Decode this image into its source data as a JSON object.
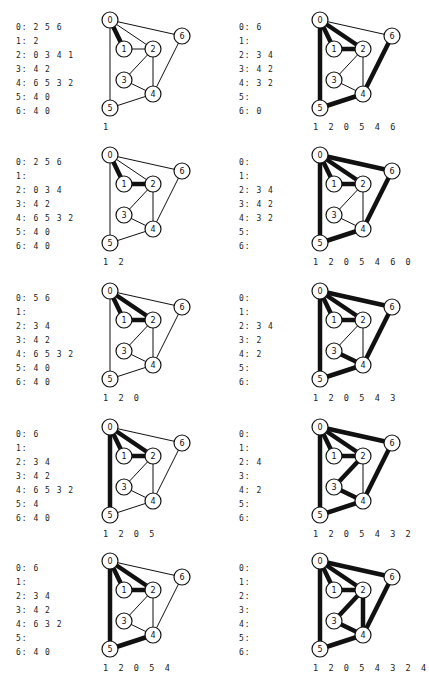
{
  "figure": {
    "nodes": [
      {
        "id": "0",
        "x": 15,
        "y": 0
      },
      {
        "id": "1",
        "x": 29,
        "y": 29
      },
      {
        "id": "2",
        "x": 58,
        "y": 29
      },
      {
        "id": "3",
        "x": 29,
        "y": 60
      },
      {
        "id": "4",
        "x": 58,
        "y": 74
      },
      {
        "id": "5",
        "x": 15,
        "y": 88
      },
      {
        "id": "6",
        "x": 87,
        "y": 16
      }
    ],
    "edges": [
      "0-1",
      "0-2",
      "0-5",
      "0-6",
      "1-2",
      "2-3",
      "2-4",
      "3-4",
      "4-5",
      "4-6"
    ],
    "panels": [
      {
        "adjacency": [
          "0: 2 5 6",
          "1: 2",
          "2: 0 3 4 1",
          "3: 4 2",
          "4: 6 5 3 2",
          "5: 4 0",
          "6: 4 0"
        ],
        "thick_edges": [
          "0-1"
        ],
        "caption": "1"
      },
      {
        "adjacency": [
          "0: 6",
          "1:",
          "2: 3 4",
          "3: 4 2",
          "4: 3 2",
          "5:",
          "6: 0"
        ],
        "thick_edges": [
          "0-1",
          "1-2",
          "0-2",
          "0-5",
          "4-5",
          "4-6"
        ],
        "caption": "1 2 0 5 4 6"
      },
      {
        "adjacency": [
          "0: 2 5 6",
          "1:",
          "2: 0 3 4",
          "3: 4 2",
          "4: 6 5 3 2",
          "5: 4 0",
          "6: 4 0"
        ],
        "thick_edges": [
          "0-1",
          "1-2"
        ],
        "caption": "1 2"
      },
      {
        "adjacency": [
          "0:",
          "1:",
          "2: 3 4",
          "3: 4 2",
          "4: 3 2",
          "5:",
          "6:"
        ],
        "thick_edges": [
          "0-1",
          "1-2",
          "0-2",
          "0-5",
          "4-5",
          "4-6",
          "0-6"
        ],
        "caption": "1 2 0 5 4 6 0"
      },
      {
        "adjacency": [
          "0: 5 6",
          "1:",
          "2: 3 4",
          "3: 4 2",
          "4: 6 5 3 2",
          "5: 4 0",
          "6: 4 0"
        ],
        "thick_edges": [
          "0-1",
          "1-2",
          "0-2"
        ],
        "caption": "1 2 0"
      },
      {
        "adjacency": [
          "0:",
          "1:",
          "2: 3 4",
          "3: 2",
          "4: 2",
          "5:",
          "6:"
        ],
        "thick_edges": [
          "0-1",
          "1-2",
          "0-2",
          "0-5",
          "4-5",
          "4-6",
          "0-6",
          "3-4"
        ],
        "caption": "1 2 0 5 4 3"
      },
      {
        "adjacency": [
          "0: 6",
          "1:",
          "2: 3 4",
          "3: 4 2",
          "4: 6 5 3 2",
          "5: 4",
          "6: 4 0"
        ],
        "thick_edges": [
          "0-1",
          "1-2",
          "0-2",
          "0-5"
        ],
        "caption": "1 2 0 5"
      },
      {
        "adjacency": [
          "0:",
          "1:",
          "2: 4",
          "3:",
          "4: 2",
          "5:",
          "6:"
        ],
        "thick_edges": [
          "0-1",
          "1-2",
          "0-2",
          "0-5",
          "4-5",
          "4-6",
          "0-6",
          "3-4",
          "2-3"
        ],
        "caption": "1 2 0 5 4 3 2"
      },
      {
        "adjacency": [
          "0: 6",
          "1:",
          "2: 3 4",
          "3: 4 2",
          "4: 6 3 2",
          "5:",
          "6: 4 0"
        ],
        "thick_edges": [
          "0-1",
          "1-2",
          "0-2",
          "0-5",
          "4-5"
        ],
        "caption": "1 2 0 5 4"
      },
      {
        "adjacency": [
          "0:",
          "1:",
          "2:",
          "3:",
          "4:",
          "5:",
          "6:"
        ],
        "thick_edges": [
          "0-1",
          "1-2",
          "0-2",
          "0-5",
          "4-5",
          "4-6",
          "0-6",
          "3-4",
          "2-3",
          "2-4"
        ],
        "caption": "1 2 0 5 4 3 2 4"
      }
    ],
    "panel_positions": [
      {
        "left": 0,
        "top": 6
      },
      {
        "left": 210,
        "top": 6
      },
      {
        "left": 0,
        "top": 141
      },
      {
        "left": 210,
        "top": 141
      },
      {
        "left": 0,
        "top": 277
      },
      {
        "left": 210,
        "top": 277
      },
      {
        "left": 0,
        "top": 413
      },
      {
        "left": 210,
        "top": 413
      },
      {
        "left": 0,
        "top": 547
      },
      {
        "left": 210,
        "top": 547
      }
    ],
    "style": {
      "line_color": "#111111",
      "node_fill": "#ffffff",
      "thin_width": 1,
      "thick_width": 4.5,
      "node_radius": 8
    }
  }
}
